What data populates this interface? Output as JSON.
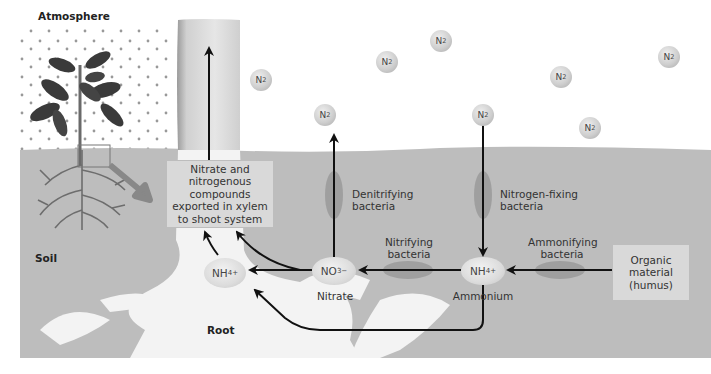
{
  "regions": {
    "atmosphere": "Atmosphere",
    "soil": "Soil",
    "root": "Root"
  },
  "export_box": "Nitrate and nitrogenous compounds exported in xylem to shoot system",
  "export_box_lines": [
    "Nitrate and",
    "nitrogenous",
    "compounds",
    "exported in xylem",
    "to shoot system"
  ],
  "organic_box_lines": [
    "Organic",
    "material",
    "(humus)"
  ],
  "bacteria": {
    "denitrifying": [
      "Denitrifying",
      "bacteria"
    ],
    "nitrogen_fixing": [
      "Nitrogen-fixing",
      "bacteria"
    ],
    "nitrifying": [
      "Nitrifying",
      "bacteria"
    ],
    "ammonifying": [
      "Ammonifying",
      "bacteria"
    ]
  },
  "ions": {
    "nitrate_formula": "NO3−",
    "nitrate_label": "Nitrate",
    "ammonium_formula": "NH4+",
    "ammonium_label": "Ammonium",
    "root_ammonium_formula": "NH4+"
  },
  "n2_molecule_label": "N2",
  "n2_molecules": [
    {
      "x": 261,
      "y": 80
    },
    {
      "x": 387,
      "y": 62
    },
    {
      "x": 441,
      "y": 41
    },
    {
      "x": 325,
      "y": 115
    },
    {
      "x": 472,
      "y": 115
    },
    {
      "x": 554,
      "y": 77
    },
    {
      "x": 582,
      "y": 127
    },
    {
      "x": 660,
      "y": 57
    }
  ],
  "colors": {
    "soil": "#bdbdbd",
    "root": "#f3f3f3",
    "sky": "#ffffff",
    "arrow": "#111111",
    "bacteria": "#8a8a8a",
    "plant_leaf": "#3a3a3a"
  }
}
